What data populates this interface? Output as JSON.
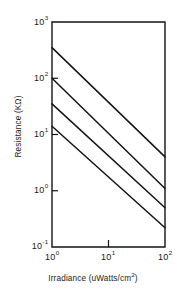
{
  "chart_data": {
    "type": "line",
    "title": "",
    "subtitle": "",
    "xlabel": "Irradiance (uWatts/cm",
    "xlabel_sup": "2",
    "xlabel_tail": ")",
    "ylabel": "Resistance (K",
    "ylabel_symbol": "Ω",
    "ylabel_tail": ")",
    "xscale": "log",
    "yscale": "log",
    "xlim": [
      1,
      100
    ],
    "ylim": [
      0.1,
      1000
    ],
    "grid": false,
    "legend": null,
    "xticks": [
      {
        "value": 1,
        "mantissa": "10",
        "exponent": "0"
      },
      {
        "value": 10,
        "mantissa": "10",
        "exponent": "1"
      },
      {
        "value": 100,
        "mantissa": "10",
        "exponent": "2"
      }
    ],
    "yticks": [
      {
        "value": 1000,
        "mantissa": "10",
        "exponent": "3"
      },
      {
        "value": 100,
        "mantissa": "10",
        "exponent": "2"
      },
      {
        "value": 10,
        "mantissa": "10",
        "exponent": "1"
      },
      {
        "value": 1,
        "mantissa": "10",
        "exponent": "0"
      },
      {
        "value": 0.1,
        "mantissa": "10",
        "exponent": "-1"
      }
    ],
    "series": [
      {
        "name": "curve-1",
        "x": [
          1,
          100
        ],
        "y": [
          350,
          4.0
        ],
        "color": "#141414"
      },
      {
        "name": "curve-2",
        "x": [
          1,
          100
        ],
        "y": [
          100,
          1.1
        ],
        "color": "#141414"
      },
      {
        "name": "curve-3",
        "x": [
          1,
          100
        ],
        "y": [
          35,
          0.5
        ],
        "color": "#141414"
      },
      {
        "name": "curve-4",
        "x": [
          1,
          100
        ],
        "y": [
          14,
          0.22
        ],
        "color": "#141414"
      }
    ],
    "axis_color": "#141414",
    "background": "#ffffff"
  }
}
